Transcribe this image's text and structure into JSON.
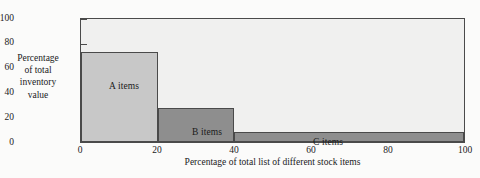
{
  "chart_data": {
    "type": "bar",
    "title": "",
    "subtitle": "",
    "xlabel": "Percentage of total list of different stock items",
    "ylabel_lines": [
      "Percentage",
      "of total",
      "inventory",
      "value"
    ],
    "ylabel": "Percentage of total inventory value",
    "xlim": [
      0,
      100
    ],
    "ylim": [
      0,
      100
    ],
    "xticks": [
      0,
      20,
      40,
      60,
      80,
      100
    ],
    "xticklabels": [
      "0",
      "20",
      "40",
      "60",
      "80",
      "100"
    ],
    "yticks": [
      0,
      20,
      40,
      60,
      80,
      100
    ],
    "yticklabels": [
      "0",
      "20",
      "40",
      "60",
      "80",
      "100"
    ],
    "grid": false,
    "legend": "none",
    "categories": [
      "A items",
      "B items",
      "C items"
    ],
    "bars": [
      {
        "label": "A items",
        "x_start": 0,
        "x_end": 20,
        "value": 73,
        "color": "#c8c8c8"
      },
      {
        "label": "B items",
        "x_start": 20,
        "x_end": 40,
        "value": 28,
        "color": "#8e8e8e"
      },
      {
        "label": "C items",
        "x_start": 40,
        "x_end": 100,
        "value": 8,
        "color": "#8e8e8e"
      }
    ],
    "values": [
      73,
      28,
      8
    ],
    "colors": {
      "bar_a": "#c8c8c8",
      "bar_b": "#8e8e8e",
      "bar_c": "#8e8e8e",
      "plot_background": "#f0f0ef",
      "page_background": "#fbfbfa",
      "axis_line": "#4a4a4a",
      "text": "#1a1a1a"
    }
  },
  "axis": {
    "y": {
      "t0": "0",
      "t1": "20",
      "t2": "40",
      "t3": "60",
      "t4": "80",
      "t5": "100"
    },
    "x": {
      "t0": "0",
      "t1": "20",
      "t2": "40",
      "t3": "60",
      "t4": "80",
      "t5": "100"
    }
  },
  "ylabel": {
    "line0": "Percentage",
    "line1": "of total",
    "line2": "inventory",
    "line3": "value"
  },
  "bar_labels": {
    "a": "A items",
    "b": "B items",
    "c": "C items"
  }
}
